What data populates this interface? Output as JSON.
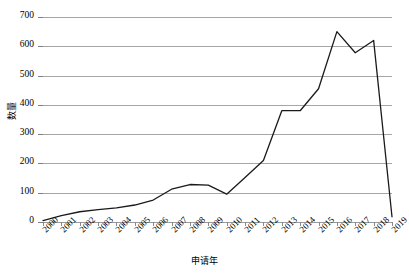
{
  "chart_data": {
    "type": "line",
    "title": "",
    "xlabel": "申请年",
    "ylabel": "数量",
    "grid": true,
    "legend": false,
    "ylim": [
      0,
      700
    ],
    "yticks": [
      0,
      100,
      200,
      300,
      400,
      500,
      600,
      700
    ],
    "categories": [
      "2000",
      "2001",
      "2002",
      "2003",
      "2004",
      "2005",
      "2006",
      "2007",
      "2008",
      "2009",
      "2010",
      "2011",
      "2012",
      "2013",
      "2014",
      "2015",
      "2016",
      "2017",
      "2018",
      "2019"
    ],
    "x": [
      2000,
      2001,
      2002,
      2003,
      2004,
      2005,
      2006,
      2007,
      2008,
      2009,
      2010,
      2011,
      2012,
      2013,
      2014,
      2015,
      2016,
      2017,
      2018,
      2019
    ],
    "series": [
      {
        "name": "数量",
        "color": "#1a1a1a",
        "values": [
          5,
          22,
          35,
          42,
          48,
          58,
          75,
          112,
          128,
          126,
          95,
          152,
          210,
          380,
          380,
          455,
          650,
          578,
          620,
          18
        ]
      }
    ]
  },
  "axes": {
    "y_title": "数量",
    "x_title": "申请年",
    "y_tick_labels": [
      "0",
      "100",
      "200",
      "300",
      "400",
      "500",
      "600",
      "700"
    ],
    "x_tick_labels": [
      "2000",
      "2001",
      "2002",
      "2003",
      "2004",
      "2005",
      "2006",
      "2007",
      "2008",
      "2009",
      "2010",
      "2011",
      "2012",
      "2013",
      "2014",
      "2015",
      "2016",
      "2017",
      "2018",
      "2019"
    ]
  },
  "style": {
    "line_color": "#1a1a1a",
    "grid_color": "#a6a6a6",
    "background": "#ffffff"
  }
}
